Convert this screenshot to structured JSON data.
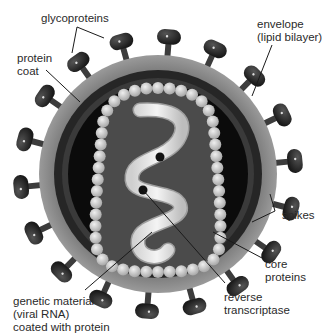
{
  "diagram": {
    "colors": {
      "background": "#ffffff",
      "envelope": "#8a8a8a",
      "protein_coat": "#2b2b2b",
      "core_dark": "#0d0d0d",
      "capsid_fill": "#4a4a4a",
      "core_protein_beads": "#cfcfcf",
      "rna": "#e8e8e8",
      "spike": "#2a2a2a",
      "leader_line": "#1a1a1a",
      "text": "#2a2a2a"
    },
    "labels": {
      "glycoproteins": "glycoproteins",
      "protein_coat": "protein\ncoat",
      "envelope": "envelope\n(lipid bilayer)",
      "spikes": "spikes",
      "core_proteins": "core\nproteins",
      "reverse_transcriptase": "reverse\ntranscriptase",
      "genetic_material": "genetic material\n(viral RNA)\ncoated with protein"
    }
  }
}
